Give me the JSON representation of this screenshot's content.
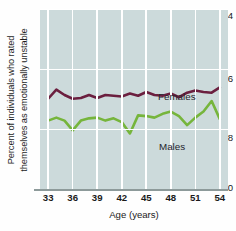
{
  "chart_data": {
    "type": "line",
    "title": "",
    "xlabel": "Age (years)",
    "ylabel": "Percent of individuals who rated themselves as emotionally unstable",
    "ylabel_line1": "Percent of individuals who rated",
    "ylabel_line2": "themselves as emotionally unstable",
    "xlim": [
      32,
      55
    ],
    "ylim": [
      0,
      24
    ],
    "yticks": [
      0,
      8,
      16,
      24
    ],
    "ytick_labels": [
      "0",
      "8",
      "16",
      "24"
    ],
    "xticks": [
      33,
      36,
      39,
      42,
      45,
      48,
      51,
      54
    ],
    "xtick_labels": [
      "33",
      "36",
      "39",
      "42",
      "45",
      "48",
      "51",
      "54"
    ],
    "grid": true,
    "grid_color": "#ffffff",
    "plot_background": "#ccdadb",
    "legend_position": "inline-annotation",
    "x": [
      33,
      34,
      35,
      36,
      37,
      38,
      39,
      40,
      41,
      42,
      43,
      44,
      45,
      46,
      47,
      48,
      49,
      50,
      51,
      52,
      53,
      54
    ],
    "series": [
      {
        "name": "Females",
        "color": "#6b1f3f",
        "values": [
          12.1,
          13.3,
          12.6,
          12.1,
          12.2,
          12.6,
          12.2,
          12.6,
          12.5,
          12.4,
          12.8,
          12.5,
          13.0,
          12.6,
          12.5,
          12.8,
          12.3,
          12.9,
          13.2,
          13.0,
          12.9,
          13.6
        ]
      },
      {
        "name": "Males",
        "color": "#76b53c",
        "values": [
          9.2,
          9.6,
          9.2,
          7.9,
          9.2,
          9.5,
          9.6,
          9.2,
          9.5,
          9.0,
          7.5,
          9.9,
          9.8,
          9.6,
          10.1,
          10.4,
          9.8,
          8.6,
          9.6,
          10.4,
          11.8,
          9.4
        ]
      }
    ],
    "annotations": [
      {
        "text": "Females",
        "series": "Females"
      },
      {
        "text": "Males",
        "series": "Males"
      }
    ]
  }
}
